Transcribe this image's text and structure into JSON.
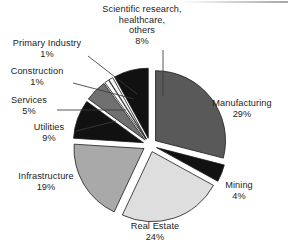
{
  "chart_data": {
    "type": "pie",
    "title": "",
    "subtitle": "",
    "xlabel": "",
    "ylabel": "",
    "legend_position": "none",
    "grid": false,
    "exploded": true,
    "units": "percent",
    "categories": [
      "Manufacturing",
      "Mining",
      "Real Estate",
      "Infrastructure",
      "Utilities",
      "Services",
      "Construction",
      "Primary Industry",
      "Scientific research, healthcare, others"
    ],
    "values": [
      29,
      4,
      24,
      19,
      9,
      5,
      1,
      1,
      8
    ],
    "slices": [
      {
        "label": "Manufacturing",
        "value": 29,
        "value_text": "29%",
        "color": "#595959",
        "start_angle": 0,
        "end_angle": 104.4
      },
      {
        "label": "Mining",
        "value": 4,
        "value_text": "4%",
        "color": "#111111",
        "start_angle": 104.4,
        "end_angle": 118.8
      },
      {
        "label": "Real Estate",
        "value": 24,
        "value_text": "24%",
        "color": "#dedede",
        "start_angle": 118.8,
        "end_angle": 205.2
      },
      {
        "label": "Infrastructure",
        "value": 19,
        "value_text": "19%",
        "color": "#a9a9a9",
        "start_angle": 205.2,
        "end_angle": 273.6
      },
      {
        "label": "Utilities",
        "value": 9,
        "value_text": "9%",
        "color": "#111111",
        "start_angle": 273.6,
        "end_angle": 306.0
      },
      {
        "label": "Services",
        "value": 5,
        "value_text": "5%",
        "color": "#707070",
        "start_angle": 306.0,
        "end_angle": 324.0
      },
      {
        "label": "Construction",
        "value": 1,
        "value_text": "1%",
        "color": "#fbfbfb",
        "start_angle": 324.0,
        "end_angle": 327.6
      },
      {
        "label": "Primary Industry",
        "value": 1,
        "value_text": "1%",
        "color": "#fbfbfb",
        "start_angle": 327.6,
        "end_angle": 331.2
      },
      {
        "label": "Scientific research, healthcare, others",
        "value": 8,
        "value_text": "8%",
        "color": "#111111",
        "start_angle": 331.2,
        "end_angle": 360.0
      }
    ]
  },
  "labels": {
    "scientific": {
      "line1": "Scientific research,",
      "line2": "healthcare,",
      "line3": "others",
      "value": "8%"
    },
    "primary_industry": {
      "name": "Primary Industry",
      "value": "1%"
    },
    "construction": {
      "name": "Construction",
      "value": "1%"
    },
    "services": {
      "name": "Services",
      "value": "5%"
    },
    "utilities": {
      "name": "Utilities",
      "value": "9%"
    },
    "infrastructure": {
      "name": "Infrastructure",
      "value": "19%"
    },
    "real_estate": {
      "name": "Real Estate",
      "value": "24%"
    },
    "mining": {
      "name": "Mining",
      "value": "4%"
    },
    "manufacturing": {
      "name": "Manufacturing",
      "value": "29%"
    }
  },
  "colors": {
    "background": "#ffffff",
    "text": "#1c1c1c",
    "outline": "#1a1a1a",
    "leader_line": "#3a3a3a"
  }
}
